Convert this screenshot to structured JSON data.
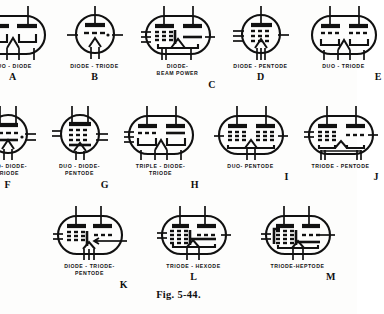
{
  "figure": {
    "caption": "Fig. 5-44."
  },
  "rows": [
    {
      "id": "row-1",
      "tubes": [
        {
          "letter": "A",
          "label": "DUO - DIODE",
          "name": "duo-diode",
          "shape": "oval",
          "w": 74,
          "h": 56
        },
        {
          "letter": "B",
          "label": "DIODE - TRIODE",
          "name": "diode-triode",
          "shape": "circle",
          "w": 54,
          "h": 56
        },
        {
          "letter": "C",
          "label": "DIODE-\nBEAM  POWER",
          "name": "diode-beam-power",
          "shape": "oval",
          "w": 74,
          "h": 56
        },
        {
          "letter": "D",
          "label": "DIODE - PENTODE",
          "name": "diode-pentode",
          "shape": "circle",
          "w": 54,
          "h": 56
        },
        {
          "letter": "E",
          "label": "DUO - TRIODE",
          "name": "duo-triode",
          "shape": "oval",
          "w": 74,
          "h": 56
        }
      ]
    },
    {
      "id": "row-2",
      "tubes": [
        {
          "letter": "F",
          "label": "DUO- DIODE-\nTRIODE",
          "name": "duo-diode-triode",
          "shape": "circle",
          "w": 54,
          "h": 56
        },
        {
          "letter": "G",
          "label": "DUO - DIODE-\nPENTODE",
          "name": "duo-diode-pentode",
          "shape": "circle",
          "w": 54,
          "h": 56
        },
        {
          "letter": "H",
          "label": "TRIPLE - DIODE-\nTRIODE",
          "name": "triple-diode-triode",
          "shape": "oval",
          "w": 74,
          "h": 56
        },
        {
          "letter": "I",
          "label": "DUO- PENTODE",
          "name": "duo-pentode",
          "shape": "oval",
          "w": 74,
          "h": 56
        },
        {
          "letter": "J",
          "label": "TRIODE - PENTODE",
          "name": "triode-pentode",
          "shape": "oval",
          "w": 74,
          "h": 56
        }
      ]
    },
    {
      "id": "row-3",
      "tubes": [
        {
          "letter": "K",
          "label": "DIODE - TRIODE-\nPENTODE",
          "name": "diode-triode-pentode",
          "shape": "oval",
          "w": 74,
          "h": 56
        },
        {
          "letter": "L",
          "label": "TRIODE - HEXODE",
          "name": "triode-hexode",
          "shape": "oval",
          "w": 74,
          "h": 56
        },
        {
          "letter": "M",
          "label": "TRIODE-HEPTODE",
          "name": "triode-heptode",
          "shape": "oval",
          "w": 74,
          "h": 56
        }
      ]
    }
  ],
  "colors": {
    "ink": "#111111",
    "paper": "#fdfdfc"
  }
}
